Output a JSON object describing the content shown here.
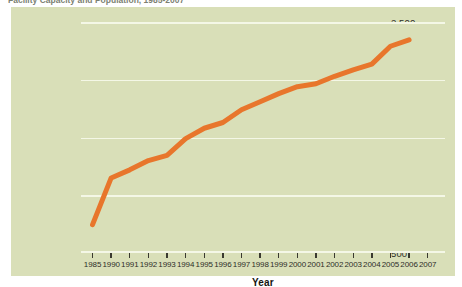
{
  "caption": "Facility Capacity and Population, 1985-2007",
  "chart_data": {
    "type": "line",
    "title": "",
    "xlabel": "Year",
    "ylabel": "Total Inmates in Custody (x1,000)",
    "xlim": [
      1985,
      2007
    ],
    "ylim": [
      500,
      2500
    ],
    "yticks": [
      "500",
      "1,000",
      "1,500",
      "2,000",
      "2,500"
    ],
    "ytick_values": [
      500,
      1000,
      1500,
      2000,
      2500
    ],
    "grid": true,
    "legend": "none",
    "line_color": "#e8762c",
    "categories": [
      "1985",
      "1990",
      "1991",
      "1992",
      "1993",
      "1994",
      "1995",
      "1996",
      "1997",
      "1998",
      "1999",
      "2000",
      "2001",
      "2002",
      "2003",
      "2004",
      "2005",
      "2006",
      "2007"
    ],
    "series": [
      {
        "name": "Total Inmates in Custody",
        "x": [
          1985,
          1990,
          1991,
          1992,
          1993,
          1994,
          1995,
          1996,
          1997,
          1998,
          1999,
          2000,
          2001,
          2002,
          2003,
          2004,
          2005,
          2006
        ],
        "values": [
          745,
          1150,
          1220,
          1300,
          1345,
          1490,
          1580,
          1630,
          1740,
          1810,
          1880,
          1940,
          1965,
          2030,
          2085,
          2135,
          2290,
          2345
        ]
      }
    ]
  },
  "colors": {
    "panel_background": "#d9dfb8",
    "gridline": "#f4f7e6",
    "series_orange": "#e8762c",
    "page_background": "#ffffff"
  }
}
